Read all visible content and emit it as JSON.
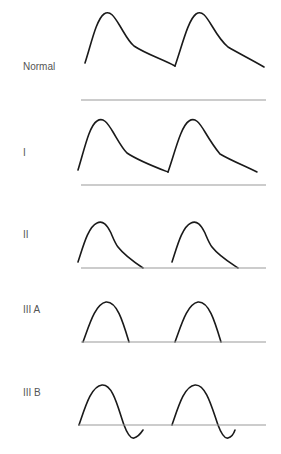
{
  "panels": [
    {
      "id": "normal",
      "label": "Normal",
      "shape": "normal"
    },
    {
      "id": "I",
      "label": "I",
      "shape": "type-I"
    },
    {
      "id": "II",
      "label": "II",
      "shape": "type-II"
    },
    {
      "id": "IIIA",
      "label": "III A",
      "shape": "type-IIIA"
    },
    {
      "id": "IIIB",
      "label": "III B",
      "shape": "type-IIIB"
    }
  ],
  "colors": {
    "wave": "#1a1a1a",
    "baseline": "#9a9a9a",
    "label": "#555555"
  }
}
